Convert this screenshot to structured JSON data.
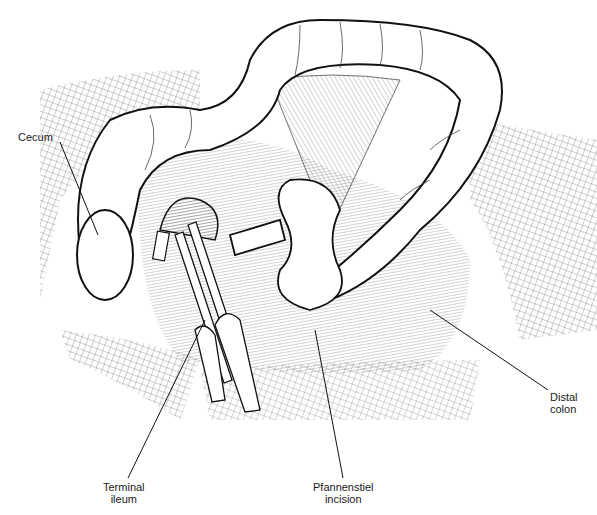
{
  "figure": {
    "labels": [
      {
        "id": "cecum",
        "text": "Cecum",
        "x": 18,
        "y": 131
      },
      {
        "id": "terminal-ileum",
        "line1": "Terminal",
        "line2": "ileum",
        "x": 103,
        "y": 481
      },
      {
        "id": "pfannenstiel-incision",
        "line1": "Pfannenstiel",
        "line2": "incision",
        "x": 313,
        "y": 481
      },
      {
        "id": "distal-colon",
        "line1": "Distal",
        "line2": "colon",
        "x": 550,
        "y": 391
      }
    ],
    "colors": {
      "ink": "#1a1a1a",
      "background": "#ffffff"
    }
  }
}
